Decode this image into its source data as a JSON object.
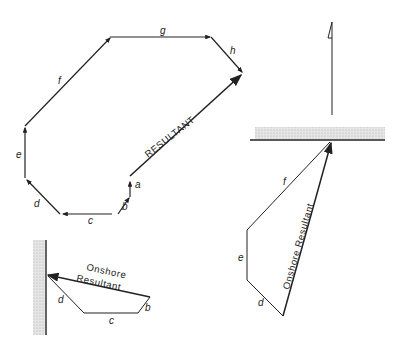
{
  "diagram": {
    "vector_polygon": {
      "segments": [
        "a",
        "b",
        "c",
        "d",
        "e",
        "f",
        "g",
        "h"
      ],
      "resultant_label": "RESULTANT"
    },
    "onshore_triangle_right": {
      "segments": [
        "d",
        "e",
        "f"
      ],
      "resultant_label": "Onshore Resultant"
    },
    "onshore_small_left": {
      "segments": [
        "b",
        "c",
        "d"
      ],
      "resultant_label_line1": "Onshore",
      "resultant_label_line2": "Resultant"
    },
    "colors": {
      "ink": "#222222",
      "shore_shade": "#cfcfcf"
    }
  }
}
